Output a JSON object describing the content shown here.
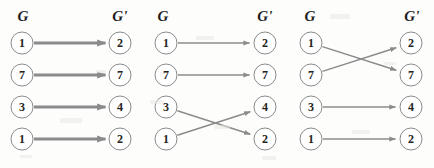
{
  "figure": {
    "width": 434,
    "height": 168,
    "background_color": "#fdfdfc",
    "edge_color": "#8b8b8b",
    "node_stroke_color": "#8b8b8b",
    "node_fill_color": "#ffffff",
    "text_color": "#232323"
  },
  "panels": [
    {
      "id": "panel-1",
      "headers": {
        "source": "G",
        "target": "G'"
      },
      "header_positions": {
        "source_x": 23,
        "target_x": 120,
        "y": 16
      },
      "columns": {
        "source_x": 22,
        "target_x": 120
      },
      "row_y": [
        43,
        75,
        107,
        139
      ],
      "edge_style": "thick",
      "edge_width": 3.0,
      "source_nodes": [
        {
          "label": "1",
          "row": 0
        },
        {
          "label": "7",
          "row": 1
        },
        {
          "label": "3",
          "row": 2
        },
        {
          "label": "1",
          "row": 3
        }
      ],
      "target_nodes": [
        {
          "label": "2",
          "row": 0
        },
        {
          "label": "7",
          "row": 1
        },
        {
          "label": "4",
          "row": 2
        },
        {
          "label": "2",
          "row": 3
        }
      ],
      "edges": [
        {
          "from_row": 0,
          "to_row": 0,
          "from_label": "1",
          "to_label": "2"
        },
        {
          "from_row": 1,
          "to_row": 1,
          "from_label": "7",
          "to_label": "7"
        },
        {
          "from_row": 2,
          "to_row": 2,
          "from_label": "3",
          "to_label": "4"
        },
        {
          "from_row": 3,
          "to_row": 3,
          "from_label": "1",
          "to_label": "2"
        }
      ]
    },
    {
      "id": "panel-2",
      "headers": {
        "source": "G",
        "target": "G'"
      },
      "header_positions": {
        "source_x": 163,
        "target_x": 265,
        "y": 16
      },
      "columns": {
        "source_x": 166,
        "target_x": 265
      },
      "row_y": [
        43,
        75,
        107,
        139
      ],
      "edge_style": "thin",
      "edge_width": 1.5,
      "source_nodes": [
        {
          "label": "1",
          "row": 0
        },
        {
          "label": "7",
          "row": 1
        },
        {
          "label": "3",
          "row": 2
        },
        {
          "label": "1",
          "row": 3
        }
      ],
      "target_nodes": [
        {
          "label": "2",
          "row": 0
        },
        {
          "label": "7",
          "row": 1
        },
        {
          "label": "4",
          "row": 2
        },
        {
          "label": "2",
          "row": 3
        }
      ],
      "edges": [
        {
          "from_row": 0,
          "to_row": 0,
          "from_label": "1",
          "to_label": "2"
        },
        {
          "from_row": 1,
          "to_row": 1,
          "from_label": "7",
          "to_label": "7"
        },
        {
          "from_row": 2,
          "to_row": 3,
          "from_label": "3",
          "to_label": "2"
        },
        {
          "from_row": 3,
          "to_row": 2,
          "from_label": "1",
          "to_label": "4"
        }
      ]
    },
    {
      "id": "panel-3",
      "headers": {
        "source": "G",
        "target": "G'"
      },
      "header_positions": {
        "source_x": 310,
        "target_x": 412,
        "y": 16
      },
      "columns": {
        "source_x": 311,
        "target_x": 411
      },
      "row_y": [
        43,
        75,
        107,
        139
      ],
      "edge_style": "thin",
      "edge_width": 1.5,
      "source_nodes": [
        {
          "label": "1",
          "row": 0
        },
        {
          "label": "7",
          "row": 1
        },
        {
          "label": "3",
          "row": 2
        },
        {
          "label": "1",
          "row": 3
        }
      ],
      "target_nodes": [
        {
          "label": "2",
          "row": 0
        },
        {
          "label": "7",
          "row": 1
        },
        {
          "label": "4",
          "row": 2
        },
        {
          "label": "2",
          "row": 3
        }
      ],
      "edges": [
        {
          "from_row": 0,
          "to_row": 1,
          "from_label": "1",
          "to_label": "7"
        },
        {
          "from_row": 1,
          "to_row": 0,
          "from_label": "7",
          "to_label": "2"
        },
        {
          "from_row": 2,
          "to_row": 2,
          "from_label": "3",
          "to_label": "4"
        },
        {
          "from_row": 3,
          "to_row": 3,
          "from_label": "1",
          "to_label": "2"
        }
      ]
    }
  ],
  "specks": [
    {
      "x": 60,
      "y": 118,
      "w": 22,
      "h": 5
    },
    {
      "x": 150,
      "y": 100,
      "w": 14,
      "h": 4
    },
    {
      "x": 196,
      "y": 36,
      "w": 18,
      "h": 4
    },
    {
      "x": 214,
      "y": 125,
      "w": 16,
      "h": 4
    },
    {
      "x": 330,
      "y": 14,
      "w": 20,
      "h": 5
    },
    {
      "x": 352,
      "y": 130,
      "w": 18,
      "h": 4
    },
    {
      "x": 96,
      "y": 70,
      "w": 10,
      "h": 3
    },
    {
      "x": 262,
      "y": 156,
      "w": 14,
      "h": 4
    },
    {
      "x": 20,
      "y": 155,
      "w": 12,
      "h": 3
    },
    {
      "x": 384,
      "y": 62,
      "w": 12,
      "h": 3
    }
  ]
}
